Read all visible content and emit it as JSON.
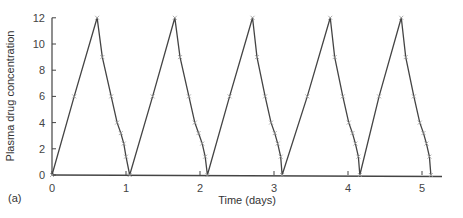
{
  "chart_data": {
    "type": "line",
    "title": "",
    "panel_label": "(a)",
    "xlabel": "Time (days)",
    "ylabel": "Plasma drug concentration",
    "xlim": [
      0,
      5.3
    ],
    "ylim": [
      0,
      12
    ],
    "xticks": [
      0,
      1,
      2,
      3,
      4,
      5
    ],
    "yticks": [
      0,
      2,
      4,
      6,
      8,
      10,
      12
    ],
    "grid": false,
    "legend": null,
    "marker": "x",
    "series": [
      {
        "name": "Plasma drug concentration",
        "x": [
          0,
          0.3,
          0.61,
          0.68,
          0.8,
          0.88,
          0.93,
          0.97,
          1.0,
          1.05,
          1.36,
          1.66,
          1.73,
          1.85,
          1.93,
          1.98,
          2.03,
          2.07,
          2.1,
          2.4,
          2.71,
          2.77,
          2.88,
          2.96,
          3.01,
          3.05,
          3.09,
          3.11,
          3.45,
          3.76,
          3.82,
          3.93,
          4.01,
          4.06,
          4.1,
          4.14,
          4.16,
          4.42,
          4.72,
          4.78,
          4.89,
          4.97,
          5.02,
          5.06,
          5.1,
          5.12
        ],
        "y": [
          0,
          6,
          12,
          9,
          6,
          4,
          3.2,
          2.4,
          1.4,
          0,
          6,
          12,
          9,
          6,
          4,
          3.2,
          2.4,
          1.4,
          0,
          6,
          12,
          9,
          6,
          4,
          3.2,
          2.4,
          1.4,
          0,
          6,
          12,
          9,
          6,
          4,
          3.2,
          2.4,
          1.4,
          0,
          6,
          12,
          9,
          6,
          4,
          3.2,
          2.4,
          1.4,
          0
        ]
      }
    ]
  },
  "layout": {
    "origin_px": [
      52,
      175
    ],
    "x_px_per_unit": 74,
    "y_px_per_unit": 13.1,
    "x_axis_end_px": 442,
    "line_color": "#444444",
    "marker_color": "#999999"
  }
}
